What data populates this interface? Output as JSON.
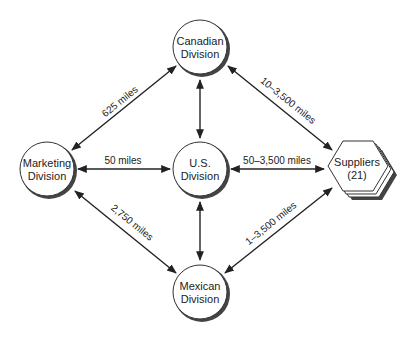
{
  "nodes": {
    "canadian": {
      "line1": "Canadian",
      "line2": "Division"
    },
    "marketing": {
      "line1": "Marketing",
      "line2": "Division"
    },
    "us": {
      "line1": "U.S.",
      "line2": "Division"
    },
    "mexican": {
      "line1": "Mexican",
      "line2": "Division"
    },
    "suppliers": {
      "line1": "Suppliers",
      "line2": "(21)"
    }
  },
  "edges": {
    "marketing_canadian": "625 miles",
    "marketing_us": "50 miles",
    "marketing_mexican": "2,750 miles",
    "canadian_suppliers": "10–3,500 miles",
    "us_suppliers": "50–3,500 miles",
    "mexican_suppliers": "1–3,500 miles"
  }
}
